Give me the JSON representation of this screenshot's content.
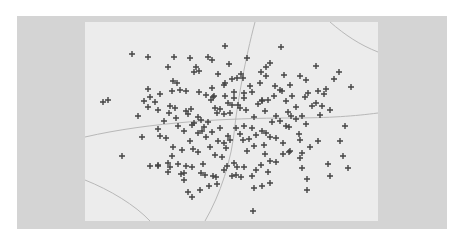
{
  "chart_data": {
    "type": "scatter",
    "title": "",
    "xlabel": "",
    "ylabel": "",
    "marker": "+",
    "grid": false,
    "legend": null,
    "colors": {
      "frame": "#d4d4d4",
      "panel": "#ececec",
      "marker": "#444444",
      "contour": "#b8b8b8"
    },
    "panel_px": {
      "x": 85,
      "y": 22,
      "w": 293,
      "h": 199
    },
    "contours_px": [
      "M255,22 C245,60 238,100 235,125 C232,160 220,195 205,221",
      "M330,22 C345,35 360,45 378,52",
      "M85,137 C150,122 230,118 290,118 C330,118 355,116 378,113",
      "M85,180 C110,190 135,205 150,221"
    ],
    "points_px": [
      [
        132,
        54
      ],
      [
        148,
        57
      ],
      [
        174,
        57
      ],
      [
        190,
        58
      ],
      [
        208,
        57
      ],
      [
        212,
        60
      ],
      [
        225,
        46
      ],
      [
        168,
        67
      ],
      [
        196,
        67
      ],
      [
        199,
        71
      ],
      [
        194,
        72
      ],
      [
        247,
        58
      ],
      [
        281,
        47
      ],
      [
        306,
        80
      ],
      [
        308,
        93
      ],
      [
        318,
        91
      ],
      [
        339,
        72
      ],
      [
        334,
        79
      ],
      [
        351,
        87
      ],
      [
        326,
        89
      ],
      [
        261,
        72
      ],
      [
        266,
        76
      ],
      [
        241,
        74
      ],
      [
        243,
        78
      ],
      [
        103,
        102
      ],
      [
        108,
        100
      ],
      [
        173,
        81
      ],
      [
        177,
        83
      ],
      [
        180,
        90
      ],
      [
        186,
        91
      ],
      [
        172,
        91
      ],
      [
        199,
        92
      ],
      [
        212,
        88
      ],
      [
        224,
        85
      ],
      [
        225,
        83
      ],
      [
        211,
        100
      ],
      [
        214,
        96
      ],
      [
        213,
        97
      ],
      [
        206,
        95
      ],
      [
        232,
        79
      ],
      [
        237,
        78
      ],
      [
        244,
        93
      ],
      [
        252,
        92
      ],
      [
        262,
        101
      ],
      [
        282,
        91
      ],
      [
        292,
        96
      ],
      [
        290,
        85
      ],
      [
        265,
        111
      ],
      [
        155,
        102
      ],
      [
        169,
        113
      ],
      [
        175,
        108
      ],
      [
        170,
        106
      ],
      [
        158,
        110
      ],
      [
        148,
        107
      ],
      [
        138,
        116
      ],
      [
        144,
        101
      ],
      [
        150,
        97
      ],
      [
        160,
        94
      ],
      [
        148,
        89
      ],
      [
        186,
        111
      ],
      [
        188,
        114
      ],
      [
        191,
        109
      ],
      [
        198,
        117
      ],
      [
        194,
        123
      ],
      [
        201,
        120
      ],
      [
        192,
        125
      ],
      [
        204,
        127
      ],
      [
        208,
        122
      ],
      [
        198,
        133
      ],
      [
        202,
        131
      ],
      [
        215,
        108
      ],
      [
        220,
        109
      ],
      [
        217,
        113
      ],
      [
        228,
        103
      ],
      [
        232,
        105
      ],
      [
        234,
        98
      ],
      [
        238,
        105
      ],
      [
        240,
        108
      ],
      [
        246,
        110
      ],
      [
        224,
        114
      ],
      [
        230,
        113
      ],
      [
        254,
        117
      ],
      [
        258,
        104
      ],
      [
        262,
        100
      ],
      [
        268,
        100
      ],
      [
        274,
        96
      ],
      [
        275,
        86
      ],
      [
        280,
        90
      ],
      [
        286,
        101
      ],
      [
        288,
        112
      ],
      [
        291,
        116
      ],
      [
        296,
        107
      ],
      [
        296,
        119
      ],
      [
        302,
        116
      ],
      [
        306,
        124
      ],
      [
        320,
        115
      ],
      [
        330,
        110
      ],
      [
        345,
        126
      ],
      [
        312,
        106
      ],
      [
        322,
        106
      ],
      [
        324,
        94
      ],
      [
        316,
        103
      ],
      [
        305,
        97
      ],
      [
        286,
        126
      ],
      [
        272,
        122
      ],
      [
        266,
        133
      ],
      [
        262,
        131
      ],
      [
        270,
        137
      ],
      [
        276,
        138
      ],
      [
        289,
        127
      ],
      [
        299,
        134
      ],
      [
        300,
        140
      ],
      [
        283,
        143
      ],
      [
        290,
        151
      ],
      [
        244,
        126
      ],
      [
        236,
        128
      ],
      [
        240,
        134
      ],
      [
        243,
        140
      ],
      [
        249,
        139
      ],
      [
        254,
        146
      ],
      [
        247,
        151
      ],
      [
        230,
        140
      ],
      [
        224,
        143
      ],
      [
        218,
        141
      ],
      [
        212,
        132
      ],
      [
        206,
        137
      ],
      [
        210,
        147
      ],
      [
        198,
        152
      ],
      [
        190,
        141
      ],
      [
        182,
        150
      ],
      [
        173,
        147
      ],
      [
        166,
        138
      ],
      [
        160,
        136
      ],
      [
        142,
        137
      ],
      [
        122,
        156
      ],
      [
        168,
        172
      ],
      [
        150,
        166
      ],
      [
        158,
        166
      ],
      [
        168,
        163
      ],
      [
        178,
        164
      ],
      [
        186,
        166
      ],
      [
        184,
        173
      ],
      [
        201,
        173
      ],
      [
        184,
        180
      ],
      [
        205,
        175
      ],
      [
        192,
        167
      ],
      [
        213,
        176
      ],
      [
        216,
        177
      ],
      [
        209,
        186
      ],
      [
        200,
        190
      ],
      [
        217,
        184
      ],
      [
        224,
        170
      ],
      [
        227,
        166
      ],
      [
        222,
        157
      ],
      [
        234,
        163
      ],
      [
        237,
        167
      ],
      [
        232,
        176
      ],
      [
        236,
        175
      ],
      [
        241,
        177
      ],
      [
        244,
        167
      ],
      [
        261,
        165
      ],
      [
        268,
        172
      ],
      [
        270,
        183
      ],
      [
        265,
        154
      ],
      [
        270,
        161
      ],
      [
        276,
        162
      ],
      [
        283,
        154
      ],
      [
        289,
        152
      ],
      [
        302,
        153
      ],
      [
        302,
        168
      ],
      [
        307,
        179
      ],
      [
        307,
        190
      ],
      [
        328,
        164
      ],
      [
        330,
        176
      ],
      [
        343,
        156
      ],
      [
        348,
        168
      ],
      [
        300,
        158
      ],
      [
        310,
        147
      ],
      [
        254,
        188
      ],
      [
        262,
        186
      ],
      [
        192,
        197
      ],
      [
        188,
        192
      ],
      [
        170,
        167
      ],
      [
        158,
        165
      ],
      [
        172,
        156
      ],
      [
        181,
        174
      ],
      [
        253,
        211
      ],
      [
        203,
        164
      ],
      [
        256,
        170
      ],
      [
        252,
        176
      ],
      [
        193,
        149
      ],
      [
        215,
        155
      ],
      [
        226,
        148
      ],
      [
        220,
        128
      ],
      [
        228,
        136
      ],
      [
        252,
        128
      ],
      [
        256,
        135
      ],
      [
        264,
        145
      ],
      [
        276,
        116
      ],
      [
        280,
        121
      ],
      [
        318,
        141
      ],
      [
        340,
        141
      ],
      [
        158,
        129
      ],
      [
        178,
        126
      ],
      [
        184,
        131
      ],
      [
        176,
        118
      ],
      [
        164,
        121
      ],
      [
        244,
        98
      ],
      [
        234,
        92
      ],
      [
        225,
        96
      ],
      [
        260,
        83
      ],
      [
        250,
        86
      ],
      [
        218,
        74
      ],
      [
        229,
        64
      ],
      [
        284,
        75
      ],
      [
        300,
        76
      ],
      [
        270,
        63
      ],
      [
        266,
        67
      ],
      [
        316,
        66
      ]
    ]
  }
}
